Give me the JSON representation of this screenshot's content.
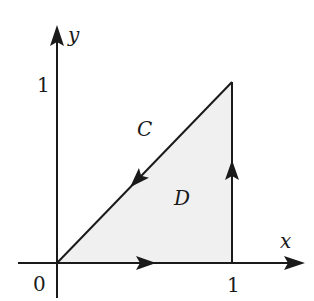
{
  "diagram": {
    "type": "line integral region",
    "region_label": "D",
    "curve_label": "C",
    "axes": {
      "x_label": "x",
      "y_label": "y",
      "origin_label": "0",
      "x_tick_label": "1",
      "y_tick_label": "1"
    },
    "vertices": [
      {
        "name": "origin",
        "x": 0,
        "y": 0
      },
      {
        "name": "bottom-right",
        "x": 1,
        "y": 0
      },
      {
        "name": "top-right",
        "x": 1,
        "y": 1
      }
    ],
    "orientation": "counterclockwise",
    "segments": [
      {
        "from": [
          0,
          0
        ],
        "to": [
          1,
          0
        ],
        "direction": "right"
      },
      {
        "from": [
          1,
          0
        ],
        "to": [
          1,
          1
        ],
        "direction": "up"
      },
      {
        "from": [
          1,
          1
        ],
        "to": [
          0,
          0
        ],
        "direction": "down-left"
      }
    ],
    "colors": {
      "stroke": "#1a1a1a",
      "region_fill": "#f0f0f0",
      "background": "#ffffff"
    }
  }
}
